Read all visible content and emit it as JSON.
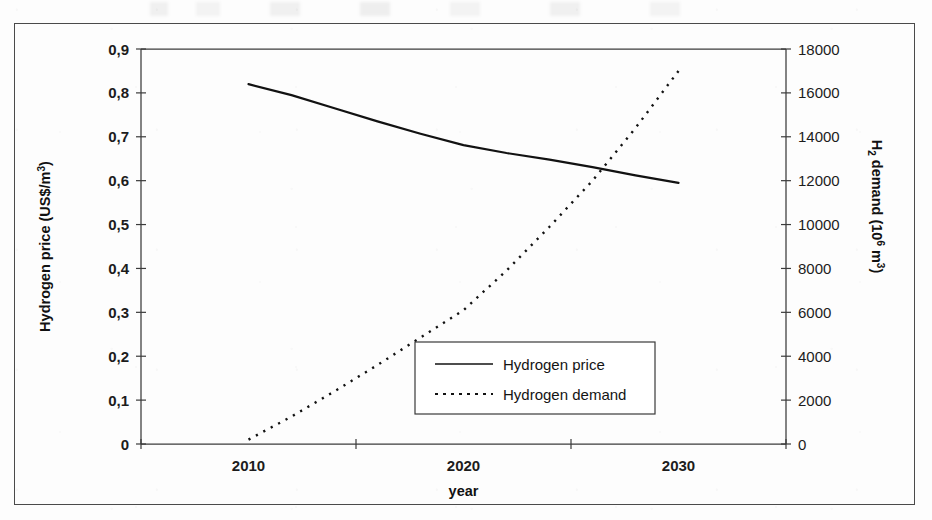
{
  "figure": {
    "background_color": "#fdfdfd",
    "frame_color": "#4a4a4a",
    "ink_color": "#121212"
  },
  "chart_data": {
    "type": "line",
    "title": "",
    "xlabel": "year",
    "grid": false,
    "legend_position": "inside-bottom-right",
    "x_tick_labels": [
      "2010",
      "2020",
      "2030"
    ],
    "x_category_positions": [
      0.5,
      1.5,
      2.5
    ],
    "axes": {
      "left": {
        "label_main": "Hydrogen price (US$/m",
        "label_sup": "3",
        "label_tail": ")",
        "label_plain": "Hydrogen price (US$/m3)",
        "ticks": [
          "0",
          "0,1",
          "0,2",
          "0,3",
          "0,4",
          "0,5",
          "0,6",
          "0,7",
          "0,8",
          "0,9"
        ],
        "min": 0,
        "max": 0.9,
        "step": 0.1
      },
      "right": {
        "label_lead": "H",
        "label_sub": "2",
        "label_mid": " demand (10",
        "label_sup": "6",
        "label_tail": " m",
        "label_sup2": "3",
        "label_end": ")",
        "label_plain": "H2 demand (10^6 m3)",
        "ticks": [
          "0",
          "2000",
          "4000",
          "6000",
          "8000",
          "10000",
          "12000",
          "14000",
          "16000",
          "18000"
        ],
        "min": 0,
        "max": 18000,
        "step": 2000
      }
    },
    "series": [
      {
        "name": "Hydrogen price",
        "axis": "left",
        "style": "solid",
        "x": [
          2010,
          2012,
          2014,
          2016,
          2018,
          2020,
          2022,
          2024,
          2026,
          2028,
          2030
        ],
        "values": [
          0.82,
          0.795,
          0.765,
          0.735,
          0.707,
          0.681,
          0.663,
          0.648,
          0.631,
          0.612,
          0.595
        ]
      },
      {
        "name": "Hydrogen demand",
        "axis": "right",
        "style": "dashed",
        "x": [
          2010,
          2012,
          2014,
          2016,
          2018,
          2020,
          2022,
          2024,
          2026,
          2028,
          2030
        ],
        "values": [
          200,
          1250,
          2400,
          3600,
          4850,
          6100,
          7900,
          9900,
          12000,
          14400,
          17000
        ]
      }
    ]
  },
  "legend": {
    "entries": [
      {
        "label": "Hydrogen price",
        "style": "solid"
      },
      {
        "label": "Hydrogen demand",
        "style": "dashed"
      }
    ]
  }
}
